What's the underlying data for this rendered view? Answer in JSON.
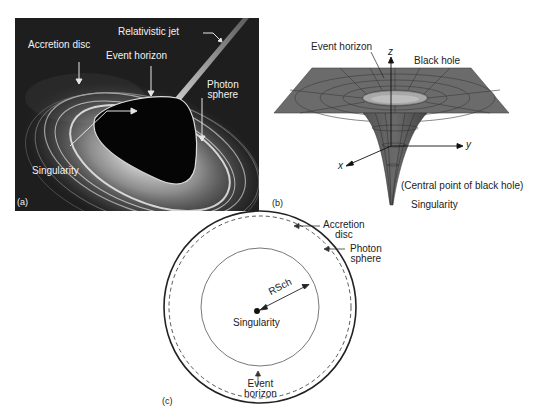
{
  "figure": {
    "panel_a": {
      "tag": "(a)",
      "labels": {
        "relativistic_jet": "Relativistic jet",
        "accretion_disc": "Accretion disc",
        "event_horizon": "Event horizon",
        "photon_sphere_line1": "Photon",
        "photon_sphere_line2": "sphere",
        "singularity": "Singularity"
      }
    },
    "panel_b": {
      "tag": "(b)",
      "labels": {
        "event_horizon": "Event horizon",
        "black_hole": "Black hole",
        "axis_z": "z",
        "axis_y": "y",
        "axis_x": "x",
        "central_point": "(Central point of black hole)",
        "singularity": "Singularity"
      }
    },
    "panel_c": {
      "tag": "(c)",
      "labels": {
        "accretion_disc_line1": "Accretion",
        "accretion_disc_line2": "disc",
        "photon_sphere_line1": "Photon",
        "photon_sphere_line2": "sphere",
        "radius": "RSch",
        "singularity": "Singularity",
        "event_horizon_line1": "Event",
        "event_horizon_line2": "horizon"
      }
    }
  }
}
